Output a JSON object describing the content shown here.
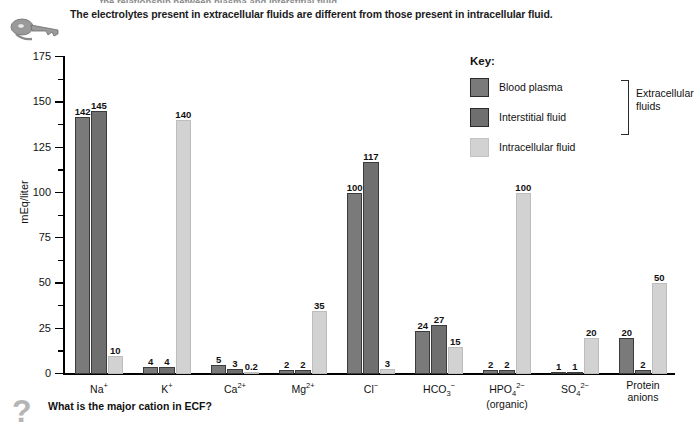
{
  "page": {
    "clipped_top_line": "the relationship between plasma and interstitial fluid",
    "header_text": "The electrolytes present in extracellular fluids are different from those present in intracellular fluid.",
    "key_icon": "key-icon",
    "question_icon": "question-mark-icon",
    "question_text": "What is the major cation in ECF?"
  },
  "legend": {
    "title": "Key:",
    "entries": [
      {
        "label": "Blood plasma",
        "color": "#7a7a7a",
        "swatch": "legend-swatch-blood-plasma"
      },
      {
        "label": "Interstitial fluid",
        "color": "#6f6f6f",
        "swatch": "legend-swatch-interstitial-fluid"
      },
      {
        "label": "Intracellular fluid",
        "color": "#d2d2d2",
        "swatch": "legend-swatch-intracellular-fluid"
      }
    ],
    "bracket_label_line1": "Extracellular",
    "bracket_label_line2": "fluids"
  },
  "chart_data": {
    "type": "bar",
    "title": "The electrolytes present in extracellular fluids are different from those present in intracellular fluid.",
    "xlabel": "",
    "ylabel": "mEq/liter",
    "ylim": [
      0,
      175
    ],
    "yticks": [
      0,
      25,
      50,
      75,
      100,
      125,
      150,
      175
    ],
    "ytick_minor_step": 12.5,
    "grid": false,
    "legend_position": "top-right",
    "categories": [
      "Na+",
      "K+",
      "Ca2+",
      "Mg2+",
      "Cl-",
      "HCO3-",
      "HPO4 2- (organic)",
      "SO4 2-",
      "Protein anions"
    ],
    "category_labels_html": [
      {
        "base": "Na",
        "sup": "+",
        "line2": ""
      },
      {
        "base": "K",
        "sup": "+",
        "line2": ""
      },
      {
        "base": "Ca",
        "sup": "2+",
        "line2": ""
      },
      {
        "base": "Mg",
        "sup": "2+",
        "line2": ""
      },
      {
        "base": "Cl",
        "sup": "−",
        "line2": ""
      },
      {
        "base": "HCO",
        "sub": "3",
        "sup": "−",
        "line2": ""
      },
      {
        "base": "HPO",
        "sub": "4",
        "sup": "2−",
        "line2": "(organic)"
      },
      {
        "base": "SO",
        "sub": "4",
        "sup": "2−",
        "line2": ""
      },
      {
        "base": "Protein",
        "sup": "",
        "line2": "anions"
      }
    ],
    "series": [
      {
        "name": "Blood plasma",
        "color": "#7a7a7a",
        "values": [
          142,
          4,
          5,
          2,
          100,
          24,
          2,
          1,
          20
        ]
      },
      {
        "name": "Interstitial fluid",
        "color": "#6f6f6f",
        "values": [
          145,
          4,
          3,
          2,
          117,
          27,
          2,
          1,
          2
        ]
      },
      {
        "name": "Intracellular fluid",
        "color": "#d2d2d2",
        "values": [
          10,
          140,
          0.2,
          35,
          3,
          15,
          100,
          20,
          50
        ]
      }
    ],
    "value_labels": [
      [
        "142",
        "145",
        "10"
      ],
      [
        "4",
        "4",
        "140"
      ],
      [
        "5",
        "3",
        "0.2"
      ],
      [
        "2",
        "2",
        "35"
      ],
      [
        "100",
        "117",
        "3"
      ],
      [
        "24",
        "27",
        "15"
      ],
      [
        "2",
        "2",
        "100"
      ],
      [
        "1",
        "1",
        "20"
      ],
      [
        "20",
        "2",
        "50"
      ]
    ]
  }
}
